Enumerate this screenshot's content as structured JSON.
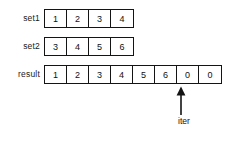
{
  "diagram": {
    "background_color": "#ffffff",
    "line_color": "#141414",
    "text_color": "#111111",
    "rows": [
      {
        "label": "set1",
        "cells": [
          "1",
          "2",
          "3",
          "4"
        ]
      },
      {
        "label": "set2",
        "cells": [
          "3",
          "4",
          "5",
          "6"
        ]
      },
      {
        "label": "result",
        "cells": [
          "1",
          "2",
          "3",
          "4",
          "5",
          "6",
          "0",
          "0"
        ]
      }
    ],
    "pointer": {
      "label": "iter",
      "icon": "arrow-up-icon",
      "points_at_index": 6
    }
  }
}
